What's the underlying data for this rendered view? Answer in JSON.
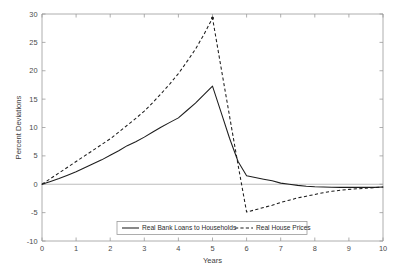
{
  "chart_data": {
    "type": "line",
    "title": "",
    "xlabel": "Years",
    "ylabel": "Percent Deviations",
    "xlim": [
      0,
      10
    ],
    "ylim": [
      -10,
      30
    ],
    "xticks": [
      "0",
      "1",
      "2",
      "3",
      "4",
      "5",
      "6",
      "7",
      "8",
      "9",
      "10"
    ],
    "yticks": [
      "-10",
      "-5",
      "0",
      "5",
      "10",
      "15",
      "20",
      "25",
      "30"
    ],
    "grid": false,
    "legend_position": "lower center",
    "series": [
      {
        "name": "Real Bank Loans to Households",
        "style": "solid",
        "color": "#1d1d1d",
        "x": [
          0,
          0.25,
          0.5,
          0.75,
          1,
          1.25,
          1.5,
          1.75,
          2,
          2.25,
          2.5,
          2.75,
          3,
          3.25,
          3.5,
          3.75,
          4,
          4.25,
          4.5,
          4.75,
          5,
          5.25,
          5.5,
          5.75,
          6,
          6.25,
          6.5,
          6.75,
          7,
          7.25,
          7.5,
          7.75,
          8,
          8.25,
          8.5,
          8.75,
          9,
          9.25,
          9.5,
          9.75,
          10
        ],
        "y": [
          0,
          0.5,
          1.0,
          1.6,
          2.2,
          2.9,
          3.6,
          4.3,
          5.1,
          5.9,
          6.8,
          7.5,
          8.3,
          9.2,
          10.1,
          10.9,
          11.7,
          13.0,
          14.3,
          15.8,
          17.3,
          12.7,
          8.1,
          4.0,
          1.5,
          1.2,
          0.9,
          0.6,
          0.2,
          0.0,
          -0.2,
          -0.35,
          -0.45,
          -0.5,
          -0.52,
          -0.55,
          -0.55,
          -0.55,
          -0.55,
          -0.55,
          -0.5
        ]
      },
      {
        "name": "Real House Prices",
        "style": "dashed",
        "color": "#1d1d1d",
        "x": [
          0,
          0.25,
          0.5,
          0.75,
          1,
          1.25,
          1.5,
          1.75,
          2,
          2.25,
          2.5,
          2.75,
          3,
          3.25,
          3.5,
          3.75,
          4,
          4.25,
          4.5,
          4.75,
          5,
          5.25,
          5.5,
          5.75,
          6,
          6.25,
          6.5,
          6.75,
          7,
          7.25,
          7.5,
          7.75,
          8,
          8.25,
          8.5,
          8.75,
          9,
          9.25,
          9.5,
          9.75,
          10
        ],
        "y": [
          0,
          1.0,
          2.0,
          3.0,
          4.0,
          5.0,
          6.0,
          7.0,
          8.0,
          9.2,
          10.4,
          11.6,
          12.9,
          14.4,
          16.0,
          17.7,
          19.5,
          21.6,
          23.8,
          26.4,
          29.3,
          20.6,
          12.0,
          3.4,
          -4.9,
          -4.5,
          -4.1,
          -3.7,
          -3.2,
          -2.8,
          -2.4,
          -2.1,
          -1.8,
          -1.5,
          -1.25,
          -1.05,
          -0.9,
          -0.8,
          -0.7,
          -0.6,
          -0.5
        ]
      }
    ],
    "peaks": {
      "real_bank_loans_peak_value": 17.3,
      "real_bank_loans_peak_year": 5,
      "real_house_prices_peak_value": 29.3,
      "real_house_prices_peak_year": 5,
      "real_house_prices_trough_value": -4.9,
      "real_house_prices_trough_year": 6
    }
  },
  "legend": {
    "entries": [
      {
        "label": "Real Bank Loans to Households"
      },
      {
        "label": "Real House Prices"
      }
    ]
  }
}
